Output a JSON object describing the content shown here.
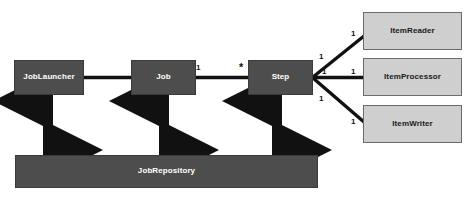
{
  "diagram": {
    "type": "uml-class-diagram",
    "canvas": {
      "width": 475,
      "height": 202
    },
    "colors": {
      "dark_node_fill": "#4d4d4d",
      "dark_node_text": "#ffffff",
      "light_node_fill": "#cfcfcf",
      "light_node_border": "#6b6b6b",
      "light_node_text": "#1a1a1a",
      "connector": "#111111",
      "background": "#ffffff"
    }
  },
  "nodes": {
    "job_launcher": {
      "label": "JobLauncher",
      "x": 14,
      "y": 60,
      "w": 70,
      "h": 35,
      "style": "dark"
    },
    "job": {
      "label": "Job",
      "x": 131,
      "y": 60,
      "w": 65,
      "h": 35,
      "style": "dark"
    },
    "step": {
      "label": "Step",
      "x": 248,
      "y": 60,
      "w": 65,
      "h": 35,
      "style": "dark"
    },
    "job_repository": {
      "label": "JobRepository",
      "x": 15,
      "y": 155,
      "w": 303,
      "h": 33,
      "style": "dark"
    },
    "item_reader": {
      "label": "ItemReader",
      "x": 363,
      "y": 12,
      "w": 99,
      "h": 38,
      "style": "light"
    },
    "item_processor": {
      "label": "ItemProcessor",
      "x": 363,
      "y": 58,
      "w": 99,
      "h": 38,
      "style": "light"
    },
    "item_writer": {
      "label": "ItemWriter",
      "x": 363,
      "y": 105,
      "w": 99,
      "h": 38,
      "style": "light"
    }
  },
  "multiplicities": {
    "job_to_step_source": {
      "text": "1",
      "x": 196,
      "y": 64
    },
    "job_to_step_target": {
      "text": "*",
      "x": 239,
      "y": 62
    },
    "step_to_reader_source": {
      "text": "1",
      "x": 319,
      "y": 53
    },
    "step_to_reader_target": {
      "text": "1",
      "x": 351,
      "y": 30
    },
    "step_to_processor_source": {
      "text": "1",
      "x": 322,
      "y": 68
    },
    "step_to_processor_target": {
      "text": "1",
      "x": 351,
      "y": 68
    },
    "step_to_writer_source": {
      "text": "1",
      "x": 319,
      "y": 95
    },
    "step_to_writer_target": {
      "text": "1",
      "x": 351,
      "y": 118
    }
  },
  "connectors": [
    {
      "name": "joblauncher-to-job",
      "kind": "association",
      "from": "job_launcher",
      "to": "job"
    },
    {
      "name": "job-to-step",
      "kind": "association",
      "from": "job",
      "to": "step"
    },
    {
      "name": "step-to-itemreader",
      "kind": "association",
      "from": "step",
      "to": "item_reader"
    },
    {
      "name": "step-to-itemprocessor",
      "kind": "association",
      "from": "step",
      "to": "item_processor"
    },
    {
      "name": "step-to-itemwriter",
      "kind": "association",
      "from": "step",
      "to": "item_writer"
    },
    {
      "name": "joblauncher-to-jobrepository",
      "kind": "bidirectional-arrow",
      "from": "job_launcher",
      "to": "job_repository"
    },
    {
      "name": "job-to-jobrepository",
      "kind": "bidirectional-arrow",
      "from": "job",
      "to": "job_repository"
    },
    {
      "name": "step-to-jobrepository",
      "kind": "bidirectional-arrow",
      "from": "step",
      "to": "job_repository"
    }
  ]
}
